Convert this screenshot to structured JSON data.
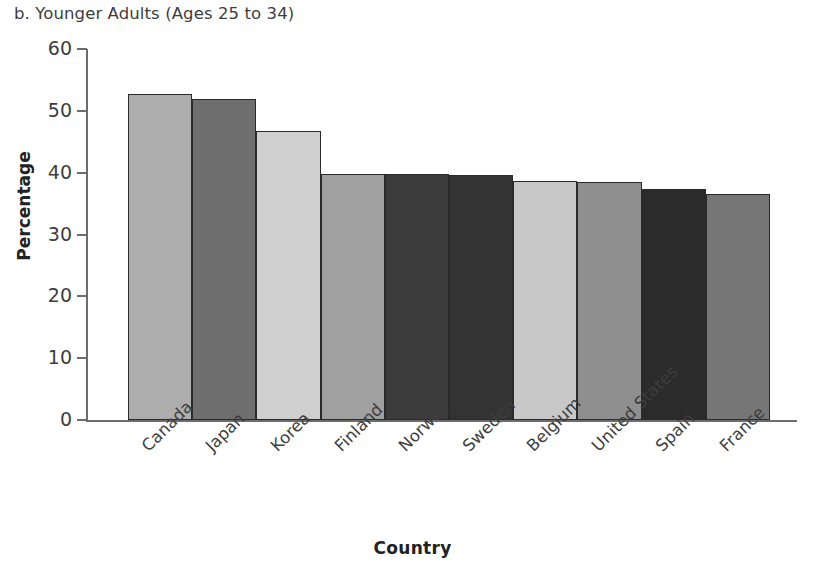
{
  "chart_data": {
    "type": "bar",
    "title": "b. Younger Adults (Ages 25 to 34)",
    "xlabel": "Country",
    "ylabel": "Percentage",
    "ylim": [
      0,
      60
    ],
    "ytick_labels": [
      "0",
      "10",
      "20",
      "30",
      "40",
      "50",
      "60"
    ],
    "ytick_values": [
      0,
      10,
      20,
      30,
      40,
      50,
      60
    ],
    "grid": false,
    "legend": "none",
    "categories": [
      "Canada",
      "Japan",
      "Korea",
      "Finland",
      "Norway",
      "Sweden",
      "Belgium",
      "United States",
      "Spain",
      "France"
    ],
    "values": [
      52.7,
      51.9,
      46.8,
      39.8,
      39.8,
      39.7,
      38.6,
      38.5,
      37.3,
      36.5
    ],
    "bar_colors": [
      "#adadad",
      "#6e6e6e",
      "#cfcfcf",
      "#a0a0a0",
      "#3c3c3c",
      "#333333",
      "#c8c8c8",
      "#8f8f8f",
      "#2b2b2b",
      "#767676"
    ],
    "bar_outline_color": "#2a2a2a",
    "axis_color": "#6d6d6d",
    "text_color": "#3d3d3d"
  }
}
